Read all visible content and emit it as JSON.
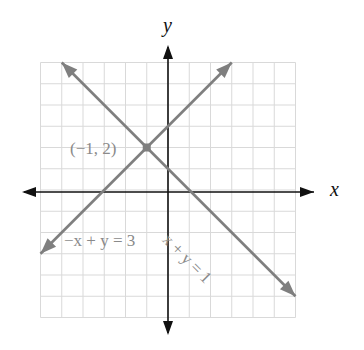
{
  "chart_data": {
    "type": "line",
    "title": "",
    "xlabel": "x",
    "ylabel": "y",
    "xlim": [
      -6,
      6
    ],
    "ylim": [
      -6,
      6
    ],
    "grid": true,
    "tick_labels": false,
    "series": [
      {
        "name": "-x + y = 3",
        "equation": "-x + y = 3",
        "color": "#7f7f7f",
        "points": [
          [
            -6,
            -3
          ],
          [
            3,
            6
          ]
        ]
      },
      {
        "name": "x + y = 1",
        "equation": "x + y = 1",
        "color": "#7f7f7f",
        "points": [
          [
            -5,
            6
          ],
          [
            6,
            -5
          ]
        ]
      }
    ],
    "annotations": [
      {
        "text": "(−1, 2)",
        "point": [
          -1,
          2
        ],
        "type": "intersection"
      },
      {
        "text": "−x + y = 3",
        "attached_to": "-x + y = 3"
      },
      {
        "text": "x + y = 1",
        "attached_to": "x + y = 1",
        "rotated": true
      }
    ]
  },
  "labels": {
    "x_axis": "x",
    "y_axis": "y",
    "intersection": "(−1, 2)",
    "line1": "−x + y = 3",
    "line2": "x + y = 1"
  },
  "colors": {
    "grid": "#d9d9d9",
    "axis": "#111111",
    "line": "#7f7f7f",
    "text_gray": "#8a8a8a"
  }
}
